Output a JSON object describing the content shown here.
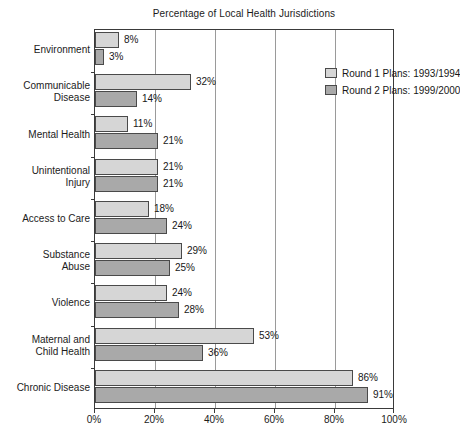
{
  "chart_data": {
    "type": "bar",
    "orientation": "horizontal",
    "title": "Percentage of Local Health Jurisdictions",
    "xlabel": "",
    "ylabel": "",
    "xlim": [
      0,
      100
    ],
    "xticks": [
      "0%",
      "20%",
      "40%",
      "60%",
      "80%",
      "100%"
    ],
    "xtick_values": [
      0,
      20,
      40,
      60,
      80,
      100
    ],
    "grid": "vertical",
    "legend_position": "top-right-inside",
    "categories": [
      "Environment",
      "Communicable Disease",
      "Mental Health",
      "Unintentional Injury",
      "Access to Care",
      "Substance Abuse",
      "Violence",
      "Maternal and Child Health",
      "Chronic Disease"
    ],
    "category_lines": [
      [
        "Environment"
      ],
      [
        "Communicable",
        "Disease"
      ],
      [
        "Mental Health"
      ],
      [
        "Unintentional",
        "Injury"
      ],
      [
        "Access to Care"
      ],
      [
        "Substance",
        "Abuse"
      ],
      [
        "Violence"
      ],
      [
        "Maternal and",
        "Child Health"
      ],
      [
        "Chronic Disease"
      ]
    ],
    "series": [
      {
        "name": "Round 1 Plans: 1993/1994",
        "color": "#d6d6d6",
        "values": [
          8,
          32,
          11,
          21,
          18,
          29,
          24,
          53,
          86
        ],
        "labels": [
          "8%",
          "32%",
          "11%",
          "21%",
          "18%",
          "29%",
          "24%",
          "53%",
          "86%"
        ]
      },
      {
        "name": "Round 2 Plans: 1999/2000",
        "color": "#a9a9a9",
        "values": [
          3,
          14,
          21,
          21,
          24,
          25,
          28,
          36,
          91
        ],
        "labels": [
          "3%",
          "14%",
          "21%",
          "21%",
          "24%",
          "25%",
          "28%",
          "36%",
          "91%"
        ]
      }
    ]
  },
  "legend": {
    "items": [
      {
        "label": "Round 1 Plans: 1993/1994",
        "color": "#d6d6d6"
      },
      {
        "label": "Round 2 Plans: 1999/2000",
        "color": "#a9a9a9"
      }
    ]
  },
  "colors": {
    "round1": "#d6d6d6",
    "round2": "#a9a9a9",
    "axis": "#3a3a3a",
    "grid": "#9a9a9a",
    "text": "#1b1b1b",
    "background": "#ffffff"
  }
}
